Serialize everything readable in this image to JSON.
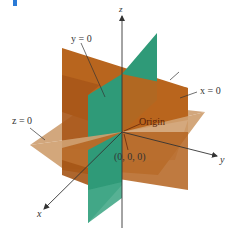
{
  "figure": {
    "colors": {
      "plane_x0": "#b8651e",
      "plane_y0": "#2f9a78",
      "plane_z0": "#c9976a",
      "axis": "#333333",
      "label": "#333333",
      "origin_label": "#5a1f08",
      "corner_mark": "#2a7ad6"
    },
    "axes": {
      "x": "x",
      "y": "y",
      "z": "z"
    },
    "planes": {
      "y0": "y = 0",
      "x0": "x = 0",
      "z0": "z = 0"
    },
    "origin": {
      "label": "Origin",
      "coords": "(0, 0, 0)"
    }
  }
}
